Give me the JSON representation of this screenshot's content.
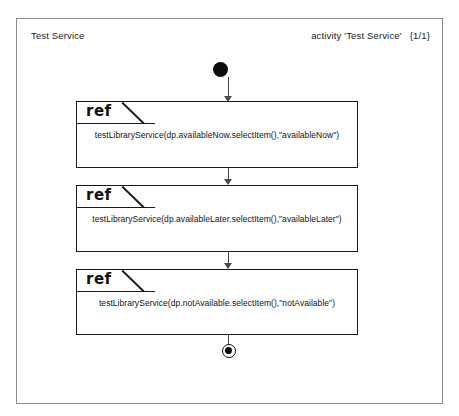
{
  "diagram": {
    "title": "Test Service",
    "meta_activity": "activity 'Test Service'",
    "meta_page": "{1/1}",
    "colors": {
      "frame_border": "#8d8d8d",
      "node_fill": "#0d0d0d",
      "box_border": "#1a1a1a",
      "connector": "#4b4b4b",
      "background": "#ffffff"
    },
    "nodes": {
      "start_label": "initial-node",
      "final_label": "activity-final-node"
    },
    "steps": [
      {
        "kind": "ref",
        "keyword": "ref",
        "expression": "testLibraryService(dp.availableNow.selectItem(),\"availableNow\")"
      },
      {
        "kind": "ref",
        "keyword": "ref",
        "expression": "testLibraryService(dp.availableLater.selectItem(),\"availableLater\")"
      },
      {
        "kind": "ref",
        "keyword": "ref",
        "expression": "testLibraryService(dp.notAvailable.selectItem(),\"notAvailable\")"
      }
    ]
  }
}
